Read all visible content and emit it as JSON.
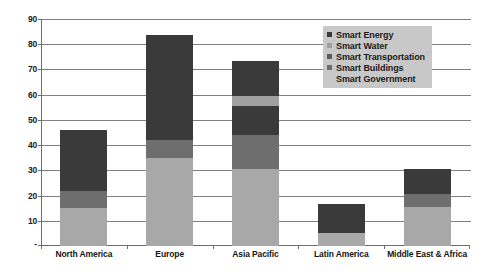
{
  "chart_data": {
    "type": "bar",
    "subtype": "stacked-bar",
    "title": "",
    "xlabel": "",
    "ylabel": "",
    "ylim": [
      0,
      90
    ],
    "ytick_labels": [
      "90",
      "80",
      "70",
      "60",
      "50",
      "40",
      "30",
      "20",
      "10",
      "-"
    ],
    "ytick_values": [
      90,
      80,
      70,
      60,
      50,
      40,
      30,
      20,
      10,
      0
    ],
    "grid": true,
    "legend_position": "top-right",
    "categories": [
      "North America",
      "Europe",
      "Asia Pacific",
      "Latin America",
      "Middle East & Africa"
    ],
    "series": [
      {
        "name": "Smart Government",
        "color": "#a8a8a8",
        "values": [
          15,
          35,
          30.5,
          5,
          15.5
        ]
      },
      {
        "name": "Smart Buildings",
        "color": "#6e6e6e",
        "values": [
          7,
          7,
          13.5,
          0,
          5
        ]
      },
      {
        "name": "Smart Transportation",
        "color": "#3a3a3a",
        "values": [
          5,
          18,
          11.5,
          0,
          5
        ]
      },
      {
        "name": "Smart Water",
        "color": "#a0a0a0",
        "values": [
          0,
          0,
          4,
          0,
          0
        ]
      },
      {
        "name": "Smart Energy",
        "color": "#3a3a3a",
        "values": [
          19,
          23.5,
          14,
          11.5,
          5
        ]
      }
    ],
    "totals": [
      46,
      83.5,
      73.5,
      16.5,
      30.5
    ],
    "legend_order": [
      "Smart Energy",
      "Smart Water",
      "Smart Transportation",
      "Smart Buildings",
      "Smart Government"
    ]
  },
  "legend": {
    "items": [
      {
        "label": "Smart Energy",
        "color": "#3a3a3a"
      },
      {
        "label": "Smart Water",
        "color": "#a0a0a0"
      },
      {
        "label": "Smart Transportation",
        "color": "#5a5a5a"
      },
      {
        "label": "Smart Buildings",
        "color": "#6e6e6e"
      },
      {
        "label": "Smart Government",
        "color": "#b4b4b4"
      }
    ]
  },
  "colors": {
    "background": "#ffffff",
    "axis": "#6e6e6e",
    "gridline": "#808080",
    "legend_background": "#c8c8c8",
    "text": "#1a1a1a"
  }
}
